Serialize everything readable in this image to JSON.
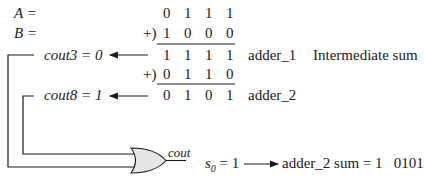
{
  "labels": {
    "a": "A =",
    "b": "B =",
    "plus1": "+)",
    "plus2": "+)",
    "cout3": "cout3 = 0",
    "cout8": "cout8 = 1",
    "adder1": "adder_1",
    "intermediate": "Intermediate sum",
    "adder2": "adder_2",
    "gate_out": "cout",
    "s0_prefix": "s",
    "s0_sub": "0",
    "s0_value": " = 1",
    "result": "adder_2 sum = 1   0101"
  },
  "rows": {
    "a": [
      "0",
      "1",
      "1",
      "1"
    ],
    "b": [
      "1",
      "0",
      "0",
      "0"
    ],
    "sum1": [
      "1",
      "1",
      "1",
      "1"
    ],
    "addend2": [
      "0",
      "1",
      "1",
      "0"
    ],
    "sum2": [
      "0",
      "1",
      "0",
      "1"
    ]
  },
  "colors": {
    "ink": "#1a1a1a",
    "gate_fill": "#e6e6e6"
  }
}
